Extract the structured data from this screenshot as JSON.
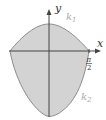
{
  "diagram": {
    "type": "function-region-plot",
    "axes": {
      "x_label": "x",
      "y_label": "y"
    },
    "curves": [
      {
        "id": "k1",
        "label": "k",
        "subscript": "1",
        "description": "upper curve, arch above x-axis"
      },
      {
        "id": "k2",
        "label": "k",
        "subscript": "2",
        "description": "lower curve, bowl below x-axis"
      }
    ],
    "tick_labels": {
      "x_right": {
        "numerator": "π",
        "denominator": "2"
      }
    },
    "colors": {
      "fill": "#d3d3d3",
      "stroke": "#8c8c8c",
      "axis": "#444444"
    }
  }
}
